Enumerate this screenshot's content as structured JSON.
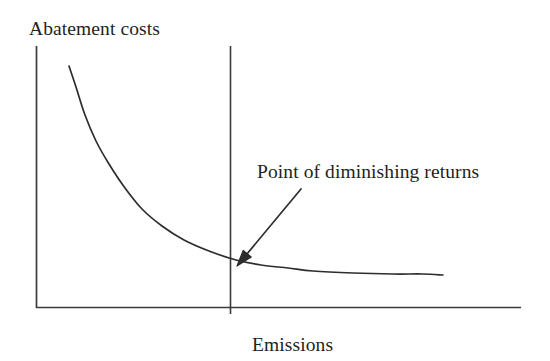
{
  "figure": {
    "background_color": "#ffffff",
    "ink_color": "#231f20"
  },
  "axes": {
    "y_axis_title": "Abatement costs",
    "x_axis_title": "Emissions",
    "y_axis_name": "abatement-costs-axis",
    "x_axis_name": "emissions-axis"
  },
  "annotation": {
    "label": "Point of diminishing returns",
    "arrow_from": [
      301,
      189
    ],
    "arrow_to": [
      237,
      266
    ]
  },
  "chart_data": {
    "type": "line",
    "title": "",
    "subtitle": "",
    "xlabel": "Emissions",
    "ylabel": "Abatement costs",
    "xlim": [
      0,
      1
    ],
    "ylim": [
      0,
      1
    ],
    "grid": false,
    "legend": "none",
    "axis_ticks": {
      "x": [],
      "y": []
    },
    "series": [
      {
        "name": "Marginal abatement cost curve",
        "description": "Convex decreasing curve: abatement costs fall steeply as emissions rise, then flatten toward an asymptote.",
        "x": [
          0.068,
          0.082,
          0.1,
          0.122,
          0.148,
          0.18,
          0.215,
          0.255,
          0.3,
          0.35,
          0.405,
          0.455,
          0.51,
          0.56,
          0.64,
          0.74,
          0.84,
          0.94
        ],
        "y": [
          0.92,
          0.843,
          0.74,
          0.645,
          0.56,
          0.47,
          0.395,
          0.33,
          0.28,
          0.238,
          0.205,
          0.185,
          0.172,
          0.163,
          0.155,
          0.15,
          0.147,
          0.145
        ],
        "pixel_points": [
          [
            69,
            66
          ],
          [
            76,
            87
          ],
          [
            85,
            115
          ],
          [
            96,
            141
          ],
          [
            109,
            164
          ],
          [
            125,
            188
          ],
          [
            142,
            209
          ],
          [
            162,
            226
          ],
          [
            184,
            240
          ],
          [
            209,
            251
          ],
          [
            236,
            260
          ],
          [
            261,
            265
          ],
          [
            288,
            268
          ],
          [
            313,
            271
          ],
          [
            353,
            273
          ],
          [
            393,
            274
          ],
          [
            423,
            274
          ],
          [
            443,
            275
          ]
        ]
      }
    ],
    "markers": [
      {
        "name": "point-of-diminishing-returns",
        "type": "vertical-line",
        "x_pixel": 230,
        "y_top_pixel": 46,
        "y_bottom_pixel": 314,
        "label": "Point of diminishing returns"
      }
    ],
    "annotations": [
      {
        "text": "Point of diminishing returns",
        "arrow": true,
        "target": "point-of-diminishing-returns"
      }
    ],
    "axis_geometry": {
      "origin_pixel": [
        36,
        308
      ],
      "y_axis_top_pixel": [
        36,
        46
      ],
      "x_axis_right_pixel": [
        521,
        308
      ]
    }
  }
}
